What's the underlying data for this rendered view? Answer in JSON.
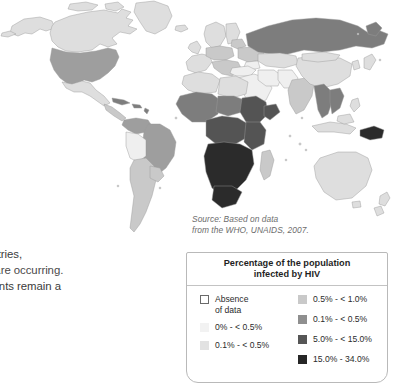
{
  "document": {
    "type": "textbook-page-figure",
    "figure_kind": "world-choropleth-map"
  },
  "body_text": {
    "lines": [
      "n",
      "lso",
      "c.",
      "e",
      "th of more",
      "ne world. This",
      "veloping countries,",
      "s of infection are occurring.",
      "edical treatments remain a"
    ],
    "note": "Left margin of paragraph is cropped off the left edge of the screenshot."
  },
  "source_note": {
    "line1": "Source: Based on data",
    "line2": "from the WHO, UNAIDS, 2007."
  },
  "legend": {
    "title_line1": "Percentage of the population",
    "title_line2": "infected by HIV",
    "left_column": [
      {
        "label": "Absence\nof data",
        "swatch": "#ffffff",
        "outlined": true
      },
      {
        "label": "0% - < 0.5%",
        "swatch": "#f2f2f2",
        "outlined": false
      },
      {
        "label": "0.1% - < 0.5%",
        "swatch": "#e2e2e2",
        "outlined": false
      }
    ],
    "right_column": [
      {
        "label": "0.5% - < 1.0%",
        "swatch": "#c9c9c9",
        "outlined": false
      },
      {
        "label": "0.1% - < 0.5%",
        "swatch": "#8f8f8f",
        "outlined": false
      },
      {
        "label": "5.0% - < 15.0%",
        "swatch": "#565656",
        "outlined": false
      },
      {
        "label": "15.0% - 34.0%",
        "swatch": "#262626",
        "outlined": false
      }
    ]
  },
  "map": {
    "title": "",
    "background": "#ffffff",
    "stroke": "#9a9a9a",
    "palette": {
      "absence": "#ffffff",
      "very_light": "#efefef",
      "light": "#dedede",
      "medium_light": "#c9c9c9",
      "medium": "#9e9e9e",
      "medium_dark": "#7d7d7d",
      "dark": "#545454",
      "very_dark": "#2b2b2b"
    },
    "regions": [
      {
        "name": "Greenland",
        "shade": "light"
      },
      {
        "name": "Canada",
        "shade": "light"
      },
      {
        "name": "United States",
        "shade": "medium"
      },
      {
        "name": "Mexico",
        "shade": "light"
      },
      {
        "name": "Central America",
        "shade": "medium_light"
      },
      {
        "name": "Caribbean",
        "shade": "medium_dark"
      },
      {
        "name": "Brazil",
        "shade": "medium"
      },
      {
        "name": "Bolivia",
        "shade": "light"
      },
      {
        "name": "Chile-Argentina",
        "shade": "medium_light"
      },
      {
        "name": "Western Europe",
        "shade": "light"
      },
      {
        "name": "Eastern Europe",
        "shade": "medium_light"
      },
      {
        "name": "Russia",
        "shade": "medium_dark"
      },
      {
        "name": "North Africa",
        "shade": "light"
      },
      {
        "name": "West Africa",
        "shade": "medium_dark"
      },
      {
        "name": "Central Africa",
        "shade": "dark"
      },
      {
        "name": "East Africa",
        "shade": "dark"
      },
      {
        "name": "Southern Africa",
        "shade": "very_dark"
      },
      {
        "name": "Madagascar",
        "shade": "medium_light"
      },
      {
        "name": "Middle East",
        "shade": "very_light"
      },
      {
        "name": "India",
        "shade": "medium_light"
      },
      {
        "name": "China",
        "shade": "light"
      },
      {
        "name": "Southeast Asia",
        "shade": "medium_dark"
      },
      {
        "name": "Indonesia",
        "shade": "light"
      },
      {
        "name": "Papua New Guinea",
        "shade": "very_dark"
      },
      {
        "name": "Australia",
        "shade": "light"
      },
      {
        "name": "New Zealand",
        "shade": "light"
      }
    ]
  }
}
